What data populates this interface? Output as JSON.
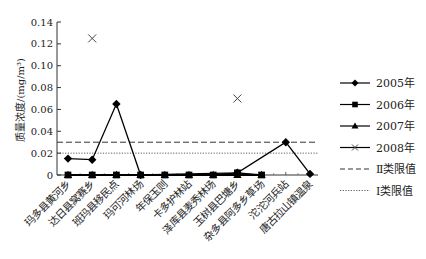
{
  "chart_data": {
    "type": "line",
    "title": "",
    "xlabel": "",
    "ylabel": "质量浓度/(mg/m³)",
    "ylim": [
      0,
      0.14
    ],
    "yticks": [
      0,
      0.02,
      0.04,
      0.06,
      0.08,
      0.1,
      0.12,
      0.14
    ],
    "ytick_labels": [
      "0",
      "0.02",
      "0.04",
      "0.06",
      "0.08",
      "0.10",
      "0.12",
      "0.14"
    ],
    "grid": false,
    "legend_position": "right",
    "categories": [
      "玛多县黄河乡",
      "达日县窝赛乡",
      "班玛县移民点",
      "玛可河林场",
      "年保玉则",
      "卡多护林站",
      "泽库县麦秀林场",
      "玉树县巴塘乡",
      "杂多县阿多乡草场",
      "沱沱河兵站",
      "唐古拉山镇温泉"
    ],
    "series": [
      {
        "name": "2005年",
        "marker": "diamond",
        "line": "solid",
        "values": [
          0.015,
          0.014,
          0.065,
          0.0,
          null,
          null,
          null,
          0.002,
          null,
          0.03,
          0.001
        ]
      },
      {
        "name": "2006年",
        "marker": "square",
        "line": "solid",
        "values": [
          0.0,
          0.0,
          0.0,
          0.0,
          0.0,
          0.0,
          0.0,
          0.002,
          0.0,
          null,
          null
        ]
      },
      {
        "name": "2007年",
        "marker": "triangle",
        "line": "solid",
        "values": [
          0.0,
          0.0,
          0.0,
          0.0,
          0.0,
          0.0,
          0.0,
          0.0,
          0.0,
          null,
          null
        ]
      },
      {
        "name": "2008年",
        "marker": "x",
        "line": "none",
        "values": [
          null,
          0.125,
          null,
          null,
          null,
          null,
          null,
          0.07,
          null,
          null,
          null
        ]
      }
    ],
    "reference_lines": [
      {
        "name": "Ⅱ类限值",
        "value": 0.03,
        "style": "dashed"
      },
      {
        "name": "Ⅰ类限值",
        "value": 0.02,
        "style": "dotted"
      }
    ]
  },
  "legend": {
    "items": [
      {
        "label": "2005年",
        "marker": "diamond",
        "style": "solid"
      },
      {
        "label": "2006年",
        "marker": "square",
        "style": "solid"
      },
      {
        "label": "2007年",
        "marker": "triangle",
        "style": "solid"
      },
      {
        "label": "2008年",
        "marker": "x",
        "style": "solid"
      },
      {
        "label": "Ⅱ类限值",
        "marker": "none",
        "style": "dashed"
      },
      {
        "label": "Ⅰ类限值",
        "marker": "none",
        "style": "dotted"
      }
    ]
  }
}
